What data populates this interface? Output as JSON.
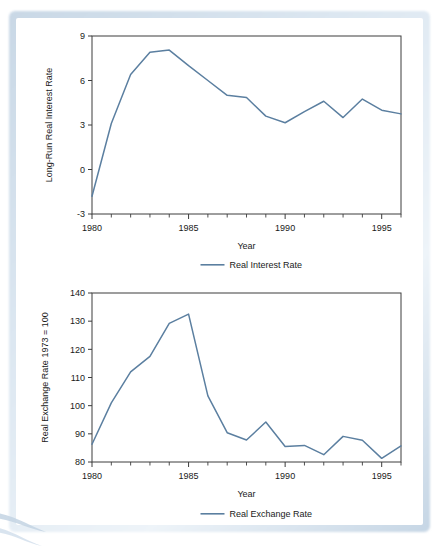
{
  "figure": {
    "accent_color": "#5b7fa0",
    "axis_color": "#3c3c3c",
    "frame_color": "#cddaea",
    "background": "#ffffff"
  },
  "chart_data": [
    {
      "type": "line",
      "id": "real-interest-rate",
      "title": "",
      "xlabel": "Year",
      "ylabel": "Long-Run Real Interest Rate",
      "xlim": [
        1980,
        1996
      ],
      "ylim": [
        -3,
        9
      ],
      "yticks": [
        -3,
        0,
        3,
        6,
        9
      ],
      "ytick_labels": [
        "-3",
        "0",
        "3",
        "6",
        "9"
      ],
      "xticks": [
        1980,
        1985,
        1990,
        1995
      ],
      "xtick_labels": [
        "1980",
        "1985",
        "1990",
        "1995"
      ],
      "minor_xticks_every": 1,
      "grid": false,
      "legend_position": "bottom-center",
      "legend": [
        "Real Interest Rate"
      ],
      "series": [
        {
          "name": "Real Interest Rate",
          "color": "#5b7fa0",
          "x": [
            1980,
            1981,
            1982,
            1983,
            1984,
            1985,
            1986,
            1987,
            1988,
            1989,
            1990,
            1991,
            1992,
            1993,
            1994,
            1995,
            1996
          ],
          "values": [
            -1.8,
            3.1,
            6.4,
            7.9,
            8.05,
            7.0,
            6.0,
            5.0,
            4.85,
            3.6,
            3.15,
            3.9,
            4.6,
            3.5,
            4.75,
            4.0,
            3.75
          ]
        }
      ]
    },
    {
      "type": "line",
      "id": "real-exchange-rate",
      "title": "",
      "xlabel": "Year",
      "ylabel": "Real Exchange Rate 1973 = 100",
      "xlim": [
        1980,
        1996
      ],
      "ylim": [
        80,
        140
      ],
      "yticks": [
        80,
        90,
        100,
        110,
        120,
        130,
        140
      ],
      "ytick_labels": [
        "80",
        "90",
        "100",
        "110",
        "120",
        "130",
        "140"
      ],
      "xticks": [
        1980,
        1985,
        1990,
        1995
      ],
      "xtick_labels": [
        "1980",
        "1985",
        "1990",
        "1995"
      ],
      "minor_xticks_every": 1,
      "grid": false,
      "legend_position": "bottom-center",
      "legend": [
        "Real Exchange Rate"
      ],
      "series": [
        {
          "name": "Real Exchange Rate",
          "color": "#5b7fa0",
          "x": [
            1980,
            1981,
            1982,
            1983,
            1984,
            1985,
            1986,
            1987,
            1988,
            1989,
            1990,
            1991,
            1992,
            1993,
            1994,
            1995,
            1996
          ],
          "values": [
            86.3,
            101.0,
            112.0,
            117.5,
            129.2,
            132.5,
            103.5,
            90.4,
            87.8,
            94.2,
            85.5,
            85.9,
            82.6,
            89.1,
            87.7,
            81.3,
            85.7
          ]
        }
      ]
    }
  ]
}
